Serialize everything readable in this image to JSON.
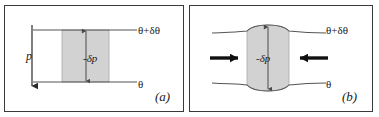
{
  "figure": {
    "type": "two-panel-physics-diagram",
    "background_color": "#ffffff",
    "border_color": "#3a3a3a",
    "line_color": "#555555",
    "shade_color": "#d2d2d2",
    "shade_stroke": "#9a9a9a",
    "arrow_color": "#1a1a1a"
  },
  "panel_a": {
    "id_label": "(a)",
    "theta_top_label": "θ+δθ",
    "theta_bottom_label": "θ",
    "element_label": "-δp",
    "pressure_label": "p",
    "description": "Flat parallel isentropes with a vertical shaded fluid element; a downward arrow on the left marks increasing pressure p."
  },
  "panel_b": {
    "id_label": "(b)",
    "theta_top_label": "θ+δθ",
    "theta_bottom_label": "θ",
    "element_label": "-δp",
    "description": "Isentropes bulge apart around the shaded fluid element, which is squeezed laterally by two opposing horizontal arrows."
  },
  "icons": {
    "down_arrow": "downward-arrow-icon",
    "right_arrow": "rightward-arrow-icon",
    "left_arrow": "leftward-arrow-icon",
    "double_arrow_vertical": "vertical-double-arrow-icon"
  }
}
